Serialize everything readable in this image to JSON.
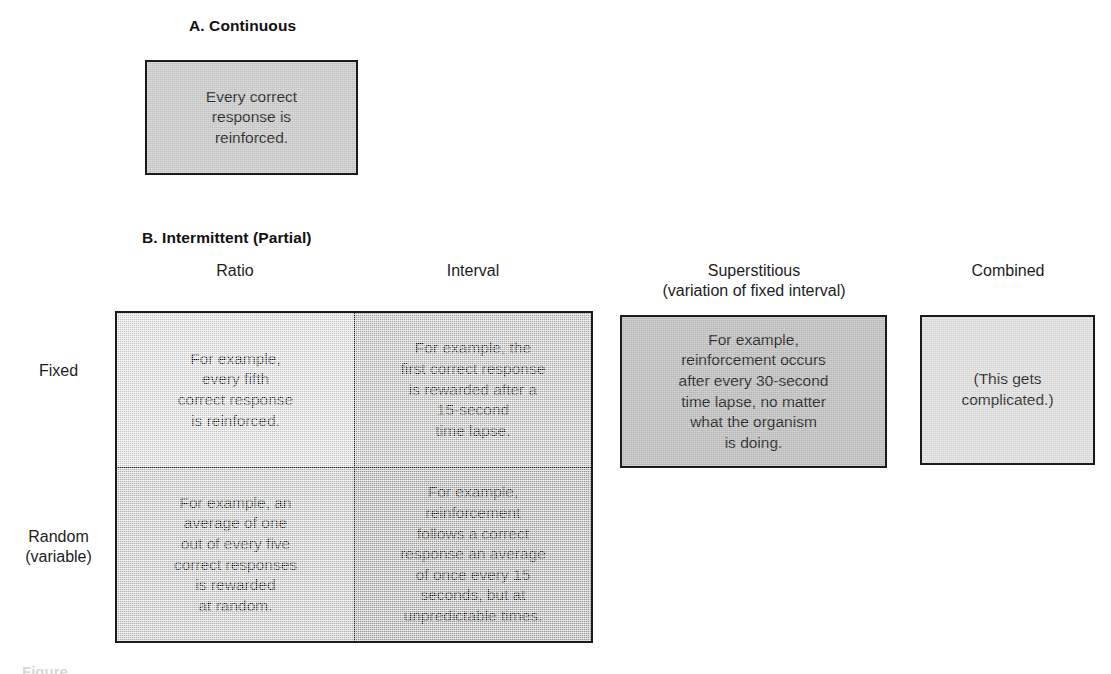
{
  "figure": {
    "background_color": "#ffffff",
    "border_color": "#1b1b1b",
    "text_color": "#151515"
  },
  "sections": {
    "a": {
      "heading": "A.  Continuous",
      "box": {
        "text": "Every correct\nresponse is\nreinforced.",
        "fill": "#c9c9c9"
      }
    },
    "b": {
      "heading": "B.  Intermittent (Partial)",
      "column_headers": {
        "ratio": "Ratio",
        "interval": "Interval",
        "superstitious": "Superstitious\n(variation of fixed interval)",
        "combined": "Combined"
      },
      "row_labels": {
        "fixed": "Fixed",
        "random": "Random\n(variable)"
      },
      "matrix": {
        "fixed_ratio": {
          "text": "For example,\nevery fifth\ncorrect response\nis reinforced.",
          "fill": "#eaeaea"
        },
        "fixed_interval": {
          "text": "For example, the\nfirst correct response\nis rewarded after a\n15-second\ntime lapse.",
          "fill": "#c6c6c6"
        },
        "random_ratio": {
          "text": "For example, an\naverage of one\nout of every five\ncorrect responses\nis rewarded\nat random.",
          "fill": "#d2d2d2"
        },
        "random_interval": {
          "text": "For example,\nreinforcement\nfollows a correct\nresponse an average\nof once every 15\nseconds, but at\nunpredictable times.",
          "fill": "#b4b4b4"
        }
      },
      "superstitious_box": {
        "text": "For example,\nreinforcement occurs\nafter every 30-second\ntime lapse, no matter\nwhat the organism\nis doing.",
        "fill": "#bdbdbd"
      },
      "combined_box": {
        "text": "(This gets\ncomplicated.)",
        "fill": "#dedede"
      }
    }
  },
  "caption_remnant": "Figure"
}
